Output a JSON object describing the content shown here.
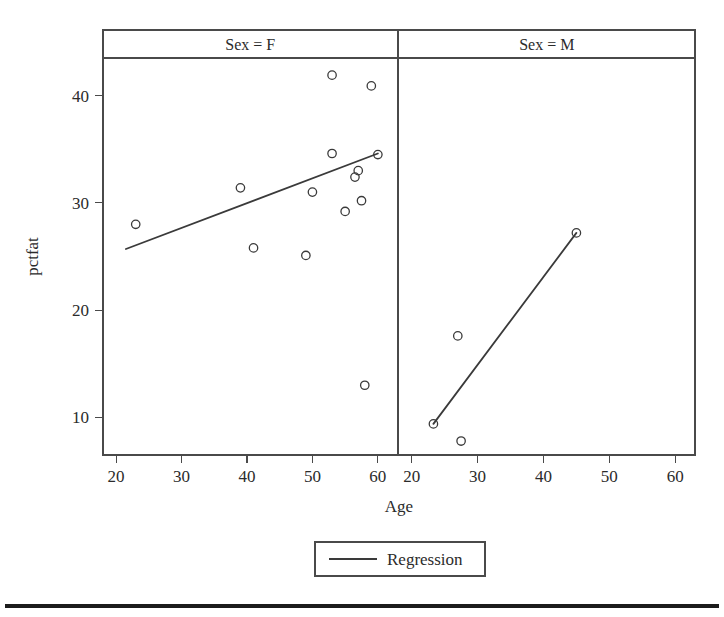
{
  "figure": {
    "background_color": "#ffffff",
    "ink_color": "#3a3a3a",
    "footer_rule": "horizontal-rule"
  },
  "chart_data": {
    "type": "scatter",
    "title": "",
    "xlabel": "Age",
    "ylabel": "pctfat",
    "xlim": [
      18,
      63
    ],
    "ylim": [
      6.5,
      43.5
    ],
    "xticks": [
      20,
      30,
      40,
      50,
      60
    ],
    "yticks": [
      10,
      20,
      30,
      40
    ],
    "grid": false,
    "legend": {
      "position": "bottom",
      "entries": [
        {
          "label": "Regression",
          "marker": "line",
          "color": "#3a3a3a"
        }
      ]
    },
    "facet_variable": "Sex",
    "panels": [
      {
        "strip_label": "Sex = F",
        "facet_value": "F",
        "points": [
          {
            "x": 23.0,
            "y": 28.0
          },
          {
            "x": 39.0,
            "y": 31.4
          },
          {
            "x": 41.0,
            "y": 25.8
          },
          {
            "x": 49.0,
            "y": 25.1
          },
          {
            "x": 50.0,
            "y": 31.0
          },
          {
            "x": 53.0,
            "y": 41.9
          },
          {
            "x": 53.0,
            "y": 34.6
          },
          {
            "x": 55.0,
            "y": 29.2
          },
          {
            "x": 56.5,
            "y": 32.4
          },
          {
            "x": 57.0,
            "y": 33.0
          },
          {
            "x": 57.5,
            "y": 30.2
          },
          {
            "x": 58.0,
            "y": 13.0
          },
          {
            "x": 59.0,
            "y": 40.9
          },
          {
            "x": 60.0,
            "y": 34.5
          }
        ],
        "regression_line": {
          "x1": 21.5,
          "y1": 25.7,
          "x2": 60.0,
          "y2": 34.6
        }
      },
      {
        "strip_label": "Sex = M",
        "facet_value": "M",
        "points": [
          {
            "x": 23.3,
            "y": 9.4
          },
          {
            "x": 27.0,
            "y": 17.6
          },
          {
            "x": 27.5,
            "y": 7.8
          },
          {
            "x": 45.0,
            "y": 27.2
          }
        ],
        "regression_line": {
          "x1": 23.3,
          "y1": 9.4,
          "x2": 45.0,
          "y2": 27.2
        }
      }
    ]
  }
}
